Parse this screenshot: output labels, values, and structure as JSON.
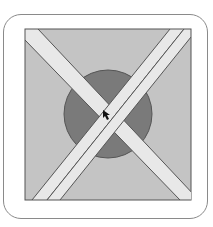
{
  "figure": {
    "colors": {
      "frame_border": "#8a8a8a",
      "square_fill": "#c4c4c4",
      "square_border": "#555555",
      "circle_fill": "#7a7a7a",
      "stripe_fill": "#e8e8e8",
      "stripe_border": "#555555",
      "cursor": "#111111"
    },
    "cursor": "arrow-cursor"
  }
}
